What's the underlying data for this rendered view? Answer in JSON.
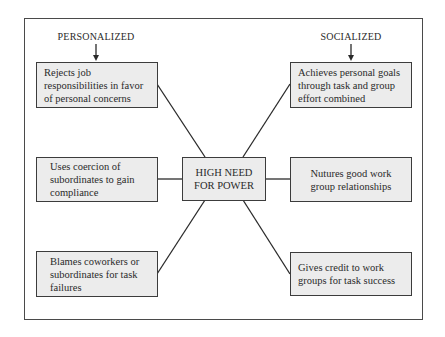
{
  "diagram": {
    "headers": {
      "left": "PERSONALIZED",
      "right": "SOCIALIZED"
    },
    "center": {
      "label": "HIGH NEED\nFOR POWER"
    },
    "personalized": [
      {
        "text": "Rejects job\nresponsibilities in favor\nof personal concerns"
      },
      {
        "text": "Uses coercion of\nsubordinates to gain\ncompliance"
      },
      {
        "text": "Blames coworkers or\nsubordinates for task\nfailures"
      }
    ],
    "socialized": [
      {
        "text": "Achieves personal goals\nthrough task and group\neffort combined"
      },
      {
        "text": "Nutures good work\ngroup relationships"
      },
      {
        "text": "Gives credit to work\ngroups for task success"
      }
    ],
    "colors": {
      "box_fill": "#ececec",
      "line": "#2a2a2a",
      "frame": "#4a4a4a"
    }
  }
}
